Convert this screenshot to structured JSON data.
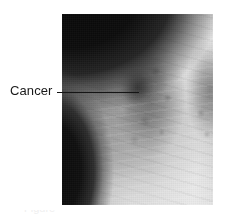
{
  "figure": {
    "width": 229,
    "height": 222,
    "background_color": "#ffffff",
    "kind": "annotated-medical-photograph"
  },
  "xray": {
    "alt": "Frontal chest radiograph showing a dense mass in the right upper lung field",
    "modality": "chest-x-ray",
    "frame": {
      "left": 62,
      "top": 14,
      "width": 151,
      "height": 191
    },
    "tones": {
      "air_black": "#060606",
      "lung_dark_gray": "#6e6e6e",
      "soft_tissue_gray": "#a8a8a8",
      "bone_light_gray": "#d8d8d8",
      "film_white": "#ececec",
      "tumor_dark": "#2a2a2a"
    },
    "regions": [
      {
        "name": "air-above-shoulder",
        "description": "black air region at upper left of film"
      },
      {
        "name": "shoulder-clavicle-bone",
        "description": "bright bony shoulder girdle and clavicle"
      },
      {
        "name": "left-lung-field",
        "description": "darker aerated lung left of centre"
      },
      {
        "name": "right-lung-field",
        "description": "darker aerated lung at right edge"
      },
      {
        "name": "mediastinum-heart",
        "description": "bright central column of heart and mediastinum"
      },
      {
        "name": "diaphragm",
        "description": "bright dome of the diaphragm at lower middle"
      },
      {
        "name": "air-outside-body-lower-left",
        "description": "black region outside the body at lower left"
      },
      {
        "name": "tumor-mass",
        "description": "dense dark rounded opacity in the upper lung field"
      }
    ]
  },
  "annotation": {
    "label": "Cancer",
    "text_color": "#1a1a1a",
    "leader_line_color": "#151515",
    "label_position": {
      "left": 10,
      "top": 84
    },
    "leader_line": {
      "left": 57,
      "top": 92,
      "length": 82,
      "thickness": 1
    },
    "points_to": "tumor-mass"
  },
  "caption": {
    "cutoff_text": "Figure",
    "visible": "partially-cropped"
  }
}
